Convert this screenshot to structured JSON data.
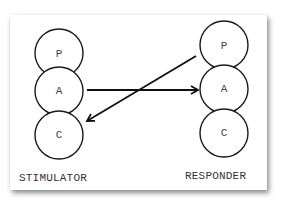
{
  "diagram": {
    "type": "transactional-analysis-crossed-transaction",
    "colors": {
      "background": "#ffffff",
      "stroke": "#1a1a1a",
      "text": "#333333"
    },
    "stimulator": {
      "label": "STIMULATOR",
      "ego_states": [
        {
          "id": "P",
          "label": "P"
        },
        {
          "id": "A",
          "label": "A"
        },
        {
          "id": "C",
          "label": "C"
        }
      ]
    },
    "responder": {
      "label": "RESPONDER",
      "ego_states": [
        {
          "id": "P",
          "label": "P"
        },
        {
          "id": "A",
          "label": "A"
        },
        {
          "id": "C",
          "label": "C"
        }
      ]
    },
    "transactions": [
      {
        "from": "stimulator.A",
        "to": "responder.A",
        "description": "stimulus: Adult to Adult"
      },
      {
        "from": "responder.P",
        "to": "stimulator.C",
        "description": "response: Parent to Child"
      }
    ]
  }
}
